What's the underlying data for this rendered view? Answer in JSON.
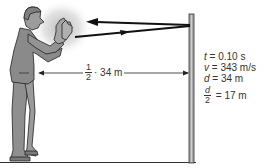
{
  "diagram": {
    "colors": {
      "figure": "#8a8a8a",
      "outline": "#222222",
      "arrow": "#111111",
      "post": "#9a9a9a",
      "text": "#333333",
      "glow": "#bdbdbd"
    },
    "elements": [
      "person-clapping",
      "sound-glow",
      "outgoing-arrow",
      "returning-arrow",
      "wall-post",
      "ground-line",
      "distance-arrow"
    ],
    "distance_label": {
      "fraction_num": "1",
      "fraction_den": "2",
      "rest": "· 34 m"
    },
    "variables": [
      {
        "symbol": "t",
        "value": " = 0.10 s"
      },
      {
        "symbol": "v",
        "value": " = 343 m/s"
      },
      {
        "symbol": "d",
        "value": " = 34 m"
      }
    ],
    "half_distance": {
      "num": "d",
      "den": "2",
      "value": " = 17 m"
    }
  }
}
